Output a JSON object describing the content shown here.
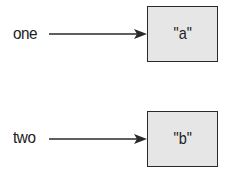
{
  "diagram": {
    "variables": [
      {
        "name": "one",
        "value": "\"a\""
      },
      {
        "name": "two",
        "value": "\"b\""
      }
    ],
    "colors": {
      "box_fill": "#e6e6e6",
      "stroke": "#2a2a2a",
      "text": "#222222"
    }
  }
}
